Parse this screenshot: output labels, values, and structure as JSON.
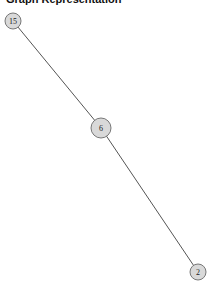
{
  "title": "Graph Representation",
  "graph": {
    "nodes": [
      {
        "id": "15",
        "label": "15",
        "x": 13,
        "y": 21,
        "r": 8
      },
      {
        "id": "6",
        "label": "6",
        "x": 101,
        "y": 128,
        "r": 10
      },
      {
        "id": "2",
        "label": "2",
        "x": 198,
        "y": 272,
        "r": 8
      }
    ],
    "edges": [
      {
        "source": "15",
        "target": "6"
      },
      {
        "source": "6",
        "target": "2"
      }
    ]
  }
}
